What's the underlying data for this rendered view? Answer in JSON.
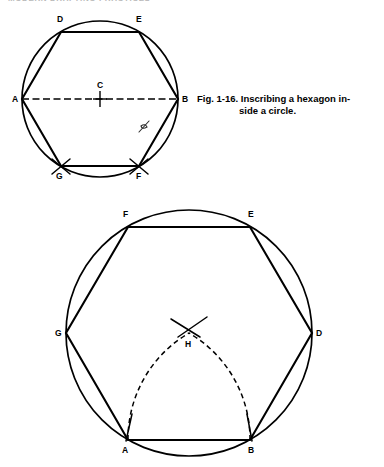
{
  "page": {
    "running_header": "MODERN DRAFTING PRACTICES",
    "header_legible": false,
    "background_color": "#ffffff",
    "ink_color": "#000000"
  },
  "caption": {
    "figure_number": "Fig. 1-16.",
    "text_line_1": "Inscribing a hexagon in-",
    "text_line_2": "side a circle."
  },
  "figure_top": {
    "name": "hexagon-inscribed-in-circle-compass-method",
    "circle": {
      "cx": 100,
      "cy": 91,
      "r": 78
    },
    "vertices": [
      {
        "label": "A",
        "x": 22,
        "y": 91,
        "label_x": 12,
        "label_y": 94
      },
      {
        "label": "D",
        "x": 61,
        "y": 24,
        "label_x": 57,
        "label_y": 14
      },
      {
        "label": "E",
        "x": 139,
        "y": 24,
        "label_x": 136,
        "label_y": 14
      },
      {
        "label": "B",
        "x": 178,
        "y": 91,
        "label_x": 182,
        "label_y": 94
      },
      {
        "label": "F",
        "x": 139,
        "y": 158,
        "label_x": 136,
        "label_y": 171
      },
      {
        "label": "G",
        "x": 61,
        "y": 158,
        "label_x": 56,
        "label_y": 171
      }
    ],
    "center": {
      "label": "C",
      "x": 100,
      "y": 91,
      "label_x": 97,
      "label_y": 80
    },
    "diameter": {
      "from": "A",
      "to": "B",
      "style": "dashed"
    },
    "construction_ticks_at": [
      "G",
      "F"
    ],
    "artifact_note": "faint handwritten scan smudge near edge B-F"
  },
  "figure_bottom": {
    "name": "hexagon-inscribed-in-circle-arc-bisector-method",
    "circle": {
      "cx": 137,
      "cy": 133,
      "r": 123
    },
    "vertices": [
      {
        "label": "A",
        "x": 76,
        "y": 240,
        "label_x": 70,
        "label_y": 253
      },
      {
        "label": "B",
        "x": 198,
        "y": 240,
        "label_x": 196,
        "label_y": 253
      },
      {
        "label": "D",
        "x": 260,
        "y": 133,
        "label_x": 264,
        "label_y": 136
      },
      {
        "label": "E",
        "x": 198,
        "y": 27,
        "label_x": 196,
        "label_y": 17
      },
      {
        "label": "F",
        "x": 76,
        "y": 27,
        "label_x": 71,
        "label_y": 17
      },
      {
        "label": "G",
        "x": 14,
        "y": 133,
        "label_x": 3,
        "label_y": 136
      }
    ],
    "intersection_point": {
      "label": "H",
      "x": 137,
      "y": 133,
      "label_x": 133,
      "label_y": 147
    },
    "dashed_arcs": [
      {
        "center": "A",
        "to": "H",
        "style": "dashed"
      },
      {
        "center": "B",
        "to": "H",
        "style": "dashed"
      }
    ],
    "construction_ticks_at": [
      "A",
      "B",
      "H"
    ]
  }
}
